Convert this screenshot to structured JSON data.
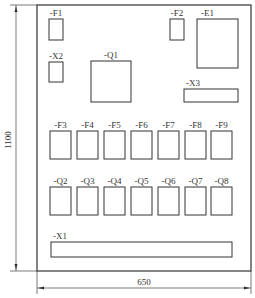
{
  "diagram": {
    "type": "electrical-panel-layout",
    "dimensions": {
      "height_label": "1100",
      "width_label": "650"
    },
    "components": [
      {
        "id": "F1",
        "label": "-F1",
        "x": 49,
        "y": 19,
        "w": 14,
        "h": 21
      },
      {
        "id": "X2",
        "label": "-X2",
        "x": 49,
        "y": 62,
        "w": 14,
        "h": 20
      },
      {
        "id": "Q1",
        "label": "-Q1",
        "x": 91,
        "y": 61,
        "w": 40,
        "h": 41
      },
      {
        "id": "F2",
        "label": "-F2",
        "x": 170,
        "y": 19,
        "w": 14,
        "h": 21
      },
      {
        "id": "E1",
        "label": "-E1",
        "x": 197,
        "y": 19,
        "w": 41,
        "h": 49
      },
      {
        "id": "X3",
        "label": "-X3",
        "x": 184,
        "y": 89,
        "w": 54,
        "h": 13
      },
      {
        "id": "F3",
        "label": "-F3",
        "x": 50,
        "y": 131,
        "w": 21,
        "h": 28
      },
      {
        "id": "F4",
        "label": "-F4",
        "x": 77,
        "y": 131,
        "w": 21,
        "h": 28
      },
      {
        "id": "F5",
        "label": "-F5",
        "x": 104,
        "y": 131,
        "w": 21,
        "h": 28
      },
      {
        "id": "F6",
        "label": "-F6",
        "x": 131,
        "y": 131,
        "w": 21,
        "h": 28
      },
      {
        "id": "F7",
        "label": "-F7",
        "x": 158,
        "y": 131,
        "w": 21,
        "h": 28
      },
      {
        "id": "F8",
        "label": "-F8",
        "x": 185,
        "y": 131,
        "w": 21,
        "h": 28
      },
      {
        "id": "F9",
        "label": "-F9",
        "x": 211,
        "y": 131,
        "w": 21,
        "h": 28
      },
      {
        "id": "Q2",
        "label": "-Q2",
        "x": 50,
        "y": 187,
        "w": 21,
        "h": 28
      },
      {
        "id": "Q3",
        "label": "-Q3",
        "x": 77,
        "y": 187,
        "w": 21,
        "h": 28
      },
      {
        "id": "Q4",
        "label": "-Q4",
        "x": 104,
        "y": 187,
        "w": 21,
        "h": 28
      },
      {
        "id": "Q5",
        "label": "-Q5",
        "x": 131,
        "y": 187,
        "w": 21,
        "h": 28
      },
      {
        "id": "Q6",
        "label": "-Q6",
        "x": 158,
        "y": 187,
        "w": 21,
        "h": 28
      },
      {
        "id": "Q7",
        "label": "-Q7",
        "x": 185,
        "y": 187,
        "w": 21,
        "h": 28
      },
      {
        "id": "Q8",
        "label": "-Q8",
        "x": 211,
        "y": 187,
        "w": 21,
        "h": 28
      },
      {
        "id": "X1",
        "label": "-X1",
        "x": 51,
        "y": 242,
        "w": 181,
        "h": 15
      }
    ]
  }
}
